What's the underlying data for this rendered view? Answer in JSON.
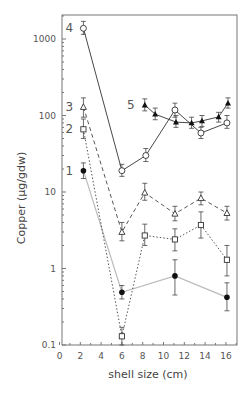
{
  "chart_data": {
    "type": "line",
    "title": "",
    "xlabel": "shell size (cm)",
    "ylabel": "Copper (μg/gdw)",
    "xlim": [
      0,
      17
    ],
    "ylim": [
      0.1,
      2000
    ],
    "yscale": "log",
    "x_ticks": [
      "0",
      "2",
      "4",
      "6",
      "8",
      "10",
      "12",
      "14",
      "16"
    ],
    "y_ticks": [
      "0.1",
      "1",
      "10",
      "100",
      "1000"
    ],
    "grid": false,
    "legend": "inline numeric labels 1-5 at series start",
    "series": [
      {
        "name": "1",
        "marker": "filled-circle",
        "line": "solid-light-gray",
        "x": [
          2.3,
          6.0,
          11.1,
          16.1
        ],
        "y": [
          19,
          0.49,
          0.8,
          0.42
        ],
        "err_hi": [
          24,
          0.6,
          1.3,
          0.65
        ],
        "err_lo": [
          15,
          0.4,
          0.45,
          0.28
        ]
      },
      {
        "name": "2",
        "marker": "open-square",
        "line": "dotted",
        "x": [
          2.3,
          6.0,
          8.2,
          11.1,
          13.6,
          16.1
        ],
        "y": [
          66,
          0.13,
          2.7,
          2.4,
          3.7,
          1.3
        ],
        "err_hi": [
          90,
          0.17,
          3.8,
          3.3,
          5.5,
          2.0
        ],
        "err_lo": [
          50,
          0.1,
          2.0,
          1.7,
          2.5,
          0.8
        ]
      },
      {
        "name": "3",
        "marker": "open-triangle",
        "line": "dashed",
        "x": [
          2.3,
          6.0,
          8.2,
          11.1,
          13.6,
          16.1
        ],
        "y": [
          129,
          3.0,
          9.8,
          5.2,
          8.3,
          5.3
        ],
        "err_hi": [
          170,
          4.0,
          13,
          6.5,
          10,
          6.5
        ],
        "err_lo": [
          95,
          2.3,
          7.8,
          4.2,
          6.8,
          4.3
        ]
      },
      {
        "name": "4",
        "marker": "open-circle",
        "line": "solid",
        "x": [
          2.3,
          6.0,
          8.3,
          11.1,
          13.6,
          16.1
        ],
        "y": [
          1380,
          19,
          30,
          118,
          59,
          80
        ],
        "err_hi": [
          1700,
          23,
          37,
          145,
          70,
          100
        ],
        "err_lo": [
          1150,
          16,
          25,
          95,
          50,
          68
        ]
      },
      {
        "name": "5",
        "marker": "filled-triangle",
        "line": "solid",
        "x": [
          8.2,
          9.2,
          11.2,
          12.7,
          13.7,
          15.3,
          16.2
        ],
        "y": [
          137,
          104,
          82,
          80,
          85,
          96,
          145
        ],
        "err_hi": [
          165,
          125,
          100,
          95,
          100,
          110,
          170
        ],
        "err_lo": [
          115,
          88,
          70,
          68,
          72,
          82,
          125
        ]
      }
    ]
  }
}
